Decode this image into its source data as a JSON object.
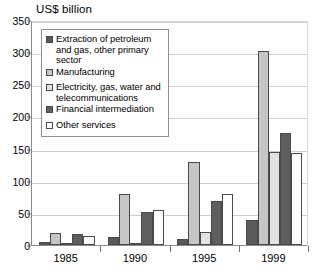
{
  "chart_data": {
    "type": "bar",
    "title": "US$ billion",
    "xlabel": "",
    "ylabel": "",
    "ylim": [
      0,
      350
    ],
    "ytick_step": 50,
    "yticks": [
      0,
      50,
      100,
      150,
      200,
      250,
      300,
      350
    ],
    "grid": true,
    "legend_position": "inside-top-left",
    "categories": [
      "1985",
      "1990",
      "1995",
      "1999"
    ],
    "series": [
      {
        "name": "Extraction of petroleum and gas, other primary sector",
        "color": "#595959",
        "values": [
          5,
          12,
          9,
          39
        ]
      },
      {
        "name": "Manufacturing",
        "color": "#c6c6c6",
        "values": [
          18,
          80,
          129,
          302
        ]
      },
      {
        "name": "Electricity, gas, water and telecommunications",
        "color": "#e2e2e2",
        "values": [
          1,
          3,
          20,
          145
        ]
      },
      {
        "name": "Financial intermediation",
        "color": "#5e5e5e",
        "values": [
          17,
          52,
          68,
          175
        ]
      },
      {
        "name": "Other services",
        "color": "#fdfdfd",
        "values": [
          14,
          55,
          80,
          143
        ]
      }
    ]
  },
  "legend": {
    "entries": [
      {
        "label": "Extraction of petroleum and gas, other primary sector"
      },
      {
        "label": "Manufacturing"
      },
      {
        "label": "Electricity, gas, water and telecommunications"
      },
      {
        "label": "Financial intermediation"
      },
      {
        "label": "Other services"
      }
    ]
  }
}
